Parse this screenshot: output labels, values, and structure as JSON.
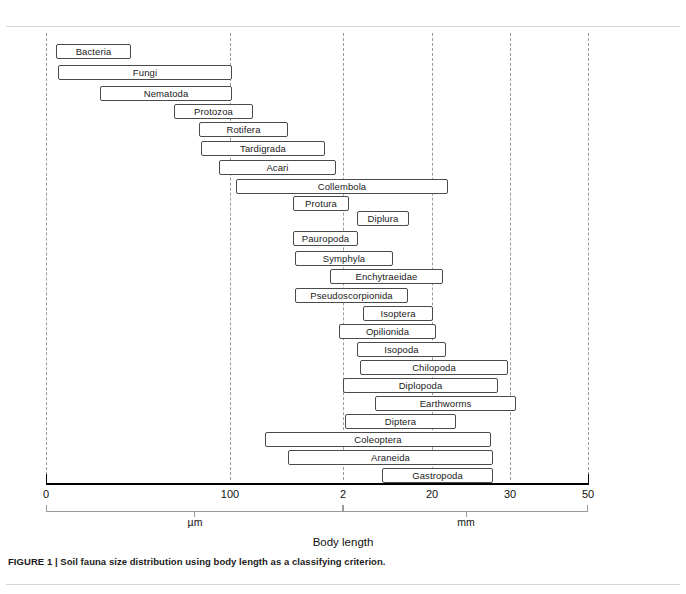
{
  "figure": {
    "caption": "FIGURE 1 | Soil fauna size distribution using body length as a classifying criterion.",
    "axis_title": "Body length",
    "units": [
      {
        "name": "micrometer-bracket",
        "label": "µm"
      },
      {
        "name": "millimeter-bracket",
        "label": "mm"
      }
    ]
  },
  "chart_data": {
    "type": "bar",
    "orientation": "horizontal",
    "title": "Soil fauna size distribution using body length as a classifying criterion.",
    "xlabel": "Body length",
    "ylabel": "",
    "grid": true,
    "legend": "none",
    "axis": {
      "tick_labels": [
        "0",
        "100",
        "2",
        "20",
        "30",
        "50"
      ],
      "tick_positions_px": [
        46,
        230,
        343,
        432,
        510,
        588
      ],
      "gridline_labels": [
        "0",
        "100",
        "2",
        "20",
        "30",
        "50"
      ],
      "unit_segments": [
        {
          "label": "µm",
          "from": "0",
          "to": "2"
        },
        {
          "label": "mm",
          "from": "2",
          "to": "50"
        }
      ]
    },
    "categories": [
      "Bacteria",
      "Fungi",
      "Nematoda",
      "Protozoa",
      "Rotifera",
      "Tardigrada",
      "Acari",
      "Collembola",
      "Protura",
      "Diplura",
      "Pauropoda",
      "Symphyla",
      "Enchytraeidae",
      "Pseudoscorpionida",
      "Isoptera",
      "Opilionida",
      "Isopoda",
      "Chilopoda",
      "Diplopoda",
      "Earthworms",
      "Diptera",
      "Coleoptera",
      "Araneida",
      "Gastropoda"
    ],
    "bars": [
      {
        "label": "Bacteria",
        "start_px": 56,
        "end_px": 131,
        "y_px": 44
      },
      {
        "label": "Fungi",
        "start_px": 58,
        "end_px": 232,
        "y_px": 65
      },
      {
        "label": "Nematoda",
        "start_px": 100,
        "end_px": 232,
        "y_px": 86
      },
      {
        "label": "Protozoa",
        "start_px": 174,
        "end_px": 253,
        "y_px": 104
      },
      {
        "label": "Rotifera",
        "start_px": 199,
        "end_px": 288,
        "y_px": 122
      },
      {
        "label": "Tardigrada",
        "start_px": 201,
        "end_px": 325,
        "y_px": 141
      },
      {
        "label": "Acari",
        "start_px": 219,
        "end_px": 336,
        "y_px": 160
      },
      {
        "label": "Collembola",
        "start_px": 236,
        "end_px": 448,
        "y_px": 179
      },
      {
        "label": "Protura",
        "start_px": 293,
        "end_px": 349,
        "y_px": 196
      },
      {
        "label": "Diplura",
        "start_px": 357,
        "end_px": 409,
        "y_px": 211
      },
      {
        "label": "Pauropoda",
        "start_px": 293,
        "end_px": 358,
        "y_px": 231
      },
      {
        "label": "Symphyla",
        "start_px": 295,
        "end_px": 393,
        "y_px": 251
      },
      {
        "label": "Enchytraeidae",
        "start_px": 330,
        "end_px": 443,
        "y_px": 269
      },
      {
        "label": "Pseudoscorpionida",
        "start_px": 295,
        "end_px": 408,
        "y_px": 288
      },
      {
        "label": "Isoptera",
        "start_px": 363,
        "end_px": 433,
        "y_px": 306
      },
      {
        "label": "Opilionida",
        "start_px": 339,
        "end_px": 436,
        "y_px": 324
      },
      {
        "label": "Isopoda",
        "start_px": 357,
        "end_px": 446,
        "y_px": 342
      },
      {
        "label": "Chilopoda",
        "start_px": 360,
        "end_px": 508,
        "y_px": 360
      },
      {
        "label": "Diplopoda",
        "start_px": 343,
        "end_px": 498,
        "y_px": 378
      },
      {
        "label": "Earthworms",
        "start_px": 375,
        "end_px": 516,
        "y_px": 396
      },
      {
        "label": "Diptera",
        "start_px": 345,
        "end_px": 456,
        "y_px": 414
      },
      {
        "label": "Coleoptera",
        "start_px": 265,
        "end_px": 491,
        "y_px": 432
      },
      {
        "label": "Araneida",
        "start_px": 288,
        "end_px": 493,
        "y_px": 450
      },
      {
        "label": "Gastropoda",
        "start_px": 382,
        "end_px": 493,
        "y_px": 468
      }
    ],
    "gridlines_px": [
      46,
      230,
      343,
      432,
      510,
      588
    ]
  }
}
